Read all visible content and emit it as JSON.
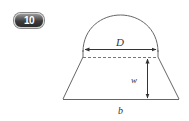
{
  "badge": {
    "label": "10"
  },
  "figure": {
    "labels": {
      "diameter": "D",
      "width": "w",
      "base": "b"
    },
    "colors": {
      "stroke": "#555555",
      "text": "#333333"
    }
  }
}
